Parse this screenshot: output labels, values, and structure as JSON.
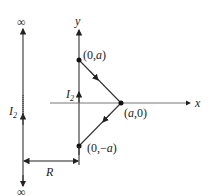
{
  "diagram": {
    "labels": {
      "infinity_top": "∞",
      "infinity_bottom": "∞",
      "y_axis": "y",
      "x_axis": "x",
      "point_top": "(0,",
      "point_top_var": "a",
      "point_top_close": ")",
      "point_right": "(",
      "point_right_var": "a",
      "point_right_close": ",0)",
      "point_bottom": "(0,−",
      "point_bottom_var": "a",
      "point_bottom_close": ")",
      "current_left": "I",
      "current_left_sub": "2",
      "current_axis": "I",
      "current_axis_sub": "2",
      "distance": "R"
    },
    "colors": {
      "line": "#333333",
      "text": "#222222"
    }
  }
}
